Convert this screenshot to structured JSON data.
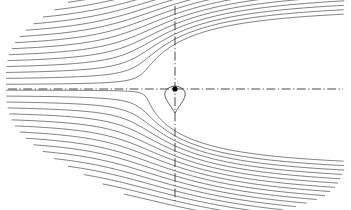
{
  "figure": {
    "title": "",
    "caption": "",
    "background_color": "#ffffff",
    "width": 351,
    "height": 210
  },
  "chart_data": {
    "type": "line",
    "title": "",
    "subtitle": "",
    "xlabel": "",
    "ylabel": "",
    "xlim": [
      -175,
      176
    ],
    "ylim": [
      -89,
      121
    ],
    "grid": false,
    "legend_position": "none",
    "annotations": [],
    "tick_labels": {
      "x": [],
      "y": []
    },
    "line_color": "#2d2d2d",
    "line_width": 0.62,
    "singularity": {
      "name": "source-point",
      "x": 175,
      "y": 89,
      "radius": 2.6,
      "color": "#000000"
    },
    "axes_overlay": [
      {
        "name": "vertical-centerline",
        "style": "dash-dot",
        "x1": 175,
        "y1": 6,
        "x2": 175,
        "y2": 204,
        "color": "#1d1d1d"
      },
      {
        "name": "horizontal-centerline",
        "style": "dash-dot",
        "x1": 8,
        "y1": 89,
        "x2": 343,
        "y2": 89,
        "color": "#1d1d1d"
      }
    ],
    "body_outline": {
      "name": "rankine-body",
      "closed": true,
      "apex_y": 86,
      "tail_y": 113,
      "half_width": 11
    },
    "streamline_count": 33,
    "streamline_spacing": 5.2,
    "series": [
      {
        "name": "streamline-01",
        "y0": -84,
        "values": []
      },
      {
        "name": "streamline-02",
        "y0": -79,
        "values": []
      },
      {
        "name": "streamline-03",
        "y0": -74,
        "values": []
      },
      {
        "name": "streamline-04",
        "y0": -69,
        "values": []
      },
      {
        "name": "streamline-05",
        "y0": -64,
        "values": []
      },
      {
        "name": "streamline-06",
        "y0": -59,
        "values": []
      },
      {
        "name": "streamline-07",
        "y0": -54,
        "values": []
      },
      {
        "name": "streamline-08",
        "y0": -49,
        "values": []
      },
      {
        "name": "streamline-09",
        "y0": -44,
        "values": []
      },
      {
        "name": "streamline-10",
        "y0": -39,
        "values": []
      },
      {
        "name": "streamline-11",
        "y0": -34,
        "values": []
      },
      {
        "name": "streamline-12",
        "y0": -29,
        "values": []
      },
      {
        "name": "streamline-13",
        "y0": -24,
        "values": []
      },
      {
        "name": "streamline-14",
        "y0": -19,
        "values": []
      },
      {
        "name": "streamline-15",
        "y0": -14,
        "values": []
      },
      {
        "name": "streamline-16",
        "y0": -9,
        "values": []
      },
      {
        "name": "streamline-17",
        "y0": -4,
        "values": []
      },
      {
        "name": "streamline-18",
        "y0": 1,
        "values": []
      },
      {
        "name": "streamline-19",
        "y0": 6,
        "values": []
      },
      {
        "name": "streamline-20",
        "y0": 11,
        "values": []
      },
      {
        "name": "streamline-21",
        "y0": 16,
        "values": []
      },
      {
        "name": "streamline-22",
        "y0": 21,
        "values": []
      },
      {
        "name": "streamline-23",
        "y0": 26,
        "values": []
      },
      {
        "name": "streamline-24",
        "y0": 31,
        "values": []
      },
      {
        "name": "streamline-25",
        "y0": 36,
        "values": []
      },
      {
        "name": "streamline-26",
        "y0": 41,
        "values": []
      },
      {
        "name": "streamline-27",
        "y0": 46,
        "values": []
      },
      {
        "name": "streamline-28",
        "y0": 51,
        "values": []
      },
      {
        "name": "streamline-29",
        "y0": 56,
        "values": []
      },
      {
        "name": "streamline-30",
        "y0": 61,
        "values": []
      },
      {
        "name": "streamline-31",
        "y0": 66,
        "values": []
      },
      {
        "name": "streamline-32",
        "y0": 71,
        "values": []
      },
      {
        "name": "streamline-33",
        "y0": 76,
        "values": []
      }
    ]
  }
}
